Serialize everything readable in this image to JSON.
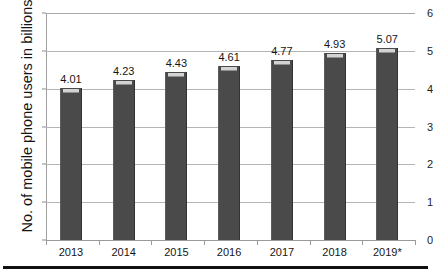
{
  "chart_data": {
    "type": "bar",
    "title": "",
    "subtitle": "",
    "xlabel": "",
    "ylabel": "No. of mobile phone users in billions",
    "categories": [
      "2013",
      "2014",
      "2015",
      "2016",
      "2017",
      "2018",
      "2019*"
    ],
    "values": [
      4.01,
      4.23,
      4.43,
      4.61,
      4.77,
      4.93,
      5.07
    ],
    "value_labels": [
      "4.01",
      "4.23",
      "4.43",
      "4.61",
      "4.77",
      "4.93",
      "5.07"
    ],
    "ylim": [
      0,
      6
    ],
    "ytick_labels": [
      "0",
      "1",
      "2",
      "3",
      "4",
      "5",
      "6"
    ],
    "ytick_values": [
      0,
      1,
      2,
      3,
      4,
      5,
      6
    ],
    "grid": true,
    "grid_axis": "y",
    "legend": false,
    "legend_position": "none",
    "series": [
      {
        "name": "Mobile phone users",
        "values": [
          4.01,
          4.23,
          4.43,
          4.61,
          4.77,
          4.93,
          5.07
        ]
      }
    ],
    "annotations": [
      {
        "text": "* denotes projected / estimated value",
        "target": "2019*"
      }
    ],
    "colors": {
      "bar_fill": "#4a4a4a",
      "bar_cap": "#d3d3d3",
      "gridline": "#b4b4b4",
      "axis": "#9a9a9a",
      "text": "#161616",
      "background": "#ffffff",
      "bottom_rule": "#111111"
    }
  }
}
